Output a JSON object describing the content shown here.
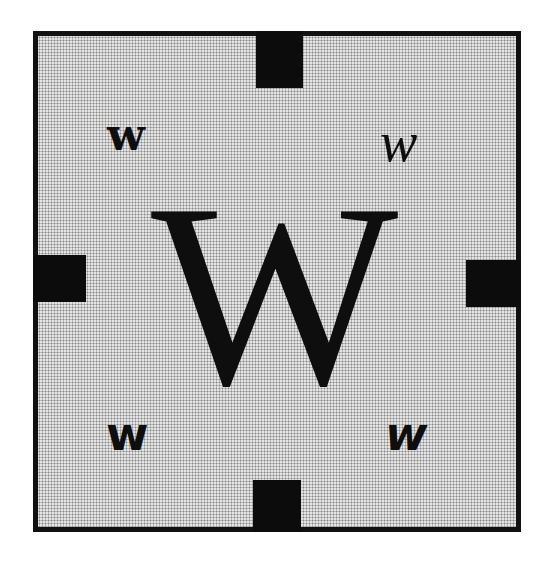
{
  "diagram": {
    "colors": {
      "frame_border": "#111111",
      "fill_background": "#e4e4e4",
      "halftone_dot": "#8a8a8a",
      "blocks": "#0c0c0c",
      "text": "#0e0e0e"
    },
    "center_letter": {
      "text": "W",
      "style": "serif regular"
    },
    "corner_letters": [
      {
        "position": "top-left",
        "text": "w",
        "style": "serif bold"
      },
      {
        "position": "top-right",
        "text": "w",
        "style": "serif italic"
      },
      {
        "position": "bottom-left",
        "text": "w",
        "style": "sans-serif bold"
      },
      {
        "position": "bottom-right",
        "text": "w",
        "style": "sans-serif bold italic"
      }
    ],
    "blocks": [
      {
        "position": "top"
      },
      {
        "position": "left"
      },
      {
        "position": "right"
      },
      {
        "position": "bottom"
      }
    ]
  }
}
